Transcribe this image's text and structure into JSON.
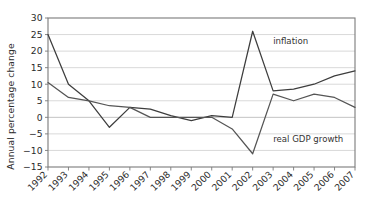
{
  "chart_data": {
    "type": "line",
    "title": "",
    "subtitle": "",
    "xlabel": "",
    "ylabel": "Annual percentage change",
    "x": [
      "1992",
      "1993",
      "1994",
      "1995",
      "1996",
      "1997",
      "1998",
      "1999",
      "2000",
      "2001",
      "2002",
      "2003",
      "2004",
      "2005",
      "2006",
      "2007"
    ],
    "categories": [
      "1992",
      "1993",
      "1994",
      "1995",
      "1996",
      "1997",
      "1998",
      "1999",
      "2000",
      "2001",
      "2002",
      "2003",
      "2004",
      "2005",
      "2006",
      "2007"
    ],
    "series": [
      {
        "name": "inflation",
        "label": "inflation",
        "color": "#3d3d3d",
        "values": [
          25,
          10,
          5,
          -3,
          3,
          2.5,
          0.5,
          -1,
          0.5,
          0,
          26,
          8,
          8.5,
          10,
          12.5,
          14
        ]
      },
      {
        "name": "real GDP growth",
        "label": "real GDP growth",
        "color": "#555555",
        "values": [
          10.5,
          6,
          5,
          3.5,
          3,
          0,
          0,
          0,
          0,
          -3.5,
          -11,
          7,
          5,
          7,
          6,
          3
        ]
      }
    ],
    "ylim": [
      -15,
      30
    ],
    "xlim": [
      0,
      15
    ],
    "yticks": [
      30,
      25,
      20,
      15,
      10,
      5,
      0,
      -5,
      -10,
      -15
    ],
    "ytick_labels": [
      "30",
      "25",
      "20",
      "15",
      "10",
      "5",
      "0",
      "−5",
      "−10",
      "−15"
    ],
    "grid": true,
    "grid_axis": "y",
    "legend": "none",
    "annotations": [
      {
        "text": "inflation",
        "x_value": "2003",
        "y_value": 22,
        "anchor": "start"
      },
      {
        "text": "real GDP growth",
        "x_value": "2003",
        "y_value": -7.5,
        "anchor": "start"
      }
    ],
    "background_color": "#ffffff",
    "axis_color": "#7a7a7a",
    "grid_color": "#c9c9c9"
  },
  "plot_geometry": {
    "left": 48,
    "right": 355,
    "top": 18,
    "bottom": 167
  }
}
